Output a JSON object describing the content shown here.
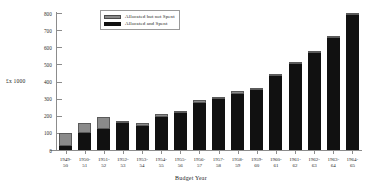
{
  "chart_data": {
    "type": "bar",
    "subtype": "stacked-bar",
    "title": "",
    "xlabel": "Budget Year",
    "ylabel": "£x 1000",
    "ylim": [
      0,
      800
    ],
    "ytick_step": 100,
    "yticks": [
      0,
      100,
      200,
      300,
      400,
      500,
      600,
      700,
      800
    ],
    "ytick_labels": [
      "0",
      "100",
      "200",
      "300",
      "400",
      "500",
      "600",
      "700",
      "800"
    ],
    "grid": false,
    "legend_position": "top-center",
    "categories": [
      "1949-50",
      "1950-51",
      "1951-52",
      "1952-53",
      "1953-54",
      "1954-55",
      "1955-56",
      "1956-57",
      "1957-58",
      "1958-59",
      "1959-60",
      "1960-61",
      "1961-62",
      "1962-63",
      "1963-64",
      "1964-65"
    ],
    "category_lines": [
      [
        "1949-",
        "50"
      ],
      [
        "1950-",
        "51"
      ],
      [
        "1951-",
        "52"
      ],
      [
        "1952-",
        "53"
      ],
      [
        "1953-",
        "54"
      ],
      [
        "1954-",
        "55"
      ],
      [
        "1955-",
        "56"
      ],
      [
        "1956-",
        "57"
      ],
      [
        "1957-",
        "58"
      ],
      [
        "1958-",
        "59"
      ],
      [
        "1959-",
        "60"
      ],
      [
        "1960-",
        "61"
      ],
      [
        "1961-",
        "62"
      ],
      [
        "1962-",
        "63"
      ],
      [
        "1963-",
        "64"
      ],
      [
        "1964-",
        "65"
      ]
    ],
    "series": [
      {
        "name": "Allocated and Spent",
        "color": "#111111",
        "values": [
          25,
          100,
          120,
          155,
          140,
          195,
          215,
          275,
          295,
          330,
          350,
          430,
          500,
          565,
          655,
          790
        ]
      },
      {
        "name": "Allocated but not Spent",
        "color": "#8a8a8a",
        "values": [
          75,
          60,
          70,
          10,
          15,
          15,
          15,
          15,
          15,
          15,
          10,
          10,
          5,
          5,
          5,
          5
        ]
      }
    ],
    "totals": [
      100,
      160,
      190,
      165,
      155,
      210,
      230,
      290,
      310,
      345,
      360,
      440,
      505,
      570,
      660,
      795
    ]
  },
  "legend": {
    "items": [
      {
        "label": "Allocated but not Spent",
        "swatch": "unspent"
      },
      {
        "label": "Allocated and Spent",
        "swatch": "spent"
      }
    ]
  }
}
